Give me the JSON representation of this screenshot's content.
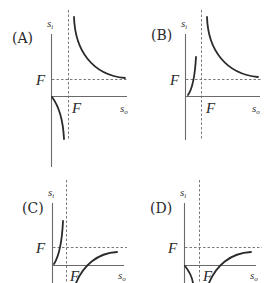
{
  "figure": {
    "axis_labels": {
      "y": "s",
      "y_sub": "i",
      "x": "s",
      "x_sub": "o"
    },
    "focal_label": "F",
    "panels": [
      {
        "id": "A",
        "label": "(A)"
      },
      {
        "id": "B",
        "label": "(B)"
      },
      {
        "id": "C",
        "label": "(C)"
      },
      {
        "id": "D",
        "label": "(D)"
      }
    ]
  },
  "colors": {
    "curve": "#2a2a2a",
    "axis": "#6a6a6a",
    "background": "#ffffff"
  }
}
